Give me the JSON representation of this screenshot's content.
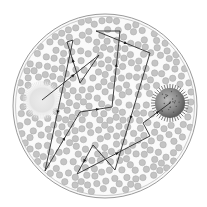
{
  "diagram": {
    "type": "random-walk-diffusion",
    "colors": {
      "background": "#ffffff",
      "container_fill": "#fafafa",
      "container_stroke": "#9a9a9a",
      "particle_fill": "#c4c4c4",
      "particle_stroke": "#a8a8a8",
      "source_sphere": "#dcdcdc",
      "target_sphere": "#7a7a7a",
      "path": "#2a2a2a"
    },
    "container": {
      "cx": 105,
      "cy": 106,
      "r": 92
    },
    "source": {
      "name": "pale-sphere",
      "cx": 42,
      "cy": 100,
      "r": 17
    },
    "target": {
      "name": "spiky-sphere",
      "cx": 170,
      "cy": 103,
      "r": 15
    },
    "path_points": [
      [
        42,
        100
      ],
      [
        99,
        55
      ],
      [
        80,
        83
      ],
      [
        67,
        42
      ],
      [
        73,
        40
      ],
      [
        45,
        171
      ],
      [
        80,
        112
      ],
      [
        112,
        107
      ],
      [
        120,
        31
      ],
      [
        96,
        31
      ],
      [
        150,
        53
      ],
      [
        115,
        170
      ],
      [
        93,
        145
      ],
      [
        77,
        174
      ],
      [
        150,
        136
      ],
      [
        143,
        123
      ],
      [
        170,
        103
      ]
    ],
    "arrow_segments": [
      0,
      2,
      4,
      5,
      6,
      7,
      9,
      10,
      12,
      13,
      15
    ],
    "particle_count": 420,
    "particle_radius": 3.2,
    "seed": 7
  }
}
